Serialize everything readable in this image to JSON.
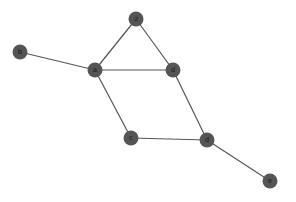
{
  "diagram": {
    "type": "node-link-graph",
    "title": "",
    "background_color": "#ffffff",
    "canvas": {
      "width": 296,
      "height": 202
    },
    "style": {
      "node_fill": "#555555",
      "node_radius": 7.5,
      "node_label_color": "#1a1a1a",
      "node_label_size": 7,
      "edge_color": "#555555",
      "edge_width": 1.2
    },
    "nodes": [
      {
        "id": "z",
        "label": "z",
        "x": 136,
        "y": 19
      },
      {
        "id": "b",
        "label": "b",
        "x": 20,
        "y": 52
      },
      {
        "id": "a",
        "label": "a",
        "x": 95,
        "y": 70
      },
      {
        "id": "f",
        "label": "d",
        "x": 173,
        "y": 70
      },
      {
        "id": "c",
        "label": "c",
        "x": 131,
        "y": 138
      },
      {
        "id": "d",
        "label": "d",
        "x": 207,
        "y": 140
      },
      {
        "id": "e",
        "label": "e",
        "x": 270,
        "y": 181
      }
    ],
    "edges": [
      {
        "source": "z",
        "target": "a"
      },
      {
        "source": "z",
        "target": "f"
      },
      {
        "source": "b",
        "target": "a"
      },
      {
        "source": "a",
        "target": "f"
      },
      {
        "source": "a",
        "target": "c"
      },
      {
        "source": "f",
        "target": "d"
      },
      {
        "source": "c",
        "target": "d"
      },
      {
        "source": "d",
        "target": "e"
      }
    ]
  }
}
